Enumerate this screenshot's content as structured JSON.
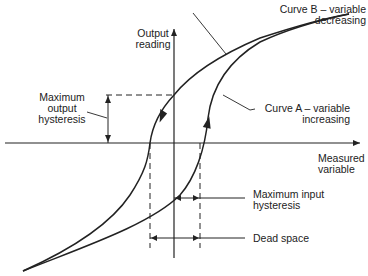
{
  "diagram": {
    "axes": {
      "y_label": [
        "Output",
        "reading"
      ],
      "x_label": [
        "Measured",
        "variable"
      ]
    },
    "curves": {
      "curve_b": [
        "Curve B – variable",
        "decreasing"
      ],
      "curve_a": [
        "Curve A – variable",
        "increasing"
      ]
    },
    "annotations": {
      "max_output_hysteresis": [
        "Maximum",
        "output",
        "hysteresis"
      ],
      "max_input_hysteresis": [
        "Maximum input",
        "hysteresis"
      ],
      "dead_space": [
        "Dead space"
      ]
    },
    "colors": {
      "line": "#222222",
      "background": "#ffffff"
    }
  }
}
